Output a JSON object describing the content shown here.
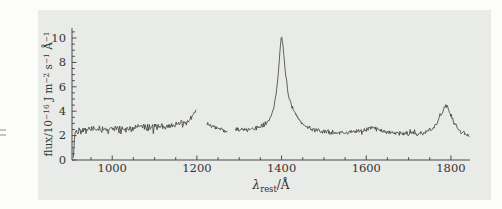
{
  "figure": {
    "page_bg": "#fcfcfb",
    "panel_bg": "#e9ebe8",
    "line_color": "#3c3c3c",
    "axis_color": "#4a4a4a",
    "text_color": "#333333"
  },
  "chart_data": {
    "type": "line",
    "title": "",
    "xlabel": "λ_rest/Å",
    "ylabel": "flux/10⁻¹⁶ J m⁻² s⁻¹ Å⁻¹",
    "xlabel_parts": [
      {
        "t": "λ",
        "style": "it"
      },
      {
        "t": "rest",
        "style": "sb"
      },
      {
        "t": "/Å",
        "style": ""
      }
    ],
    "ylabel_parts": [
      {
        "t": "flux/10",
        "style": ""
      },
      {
        "t": "−16",
        "style": "sp"
      },
      {
        "t": " J m",
        "style": ""
      },
      {
        "t": "−2",
        "style": "sp"
      },
      {
        "t": " s",
        "style": ""
      },
      {
        "t": "−1",
        "style": "sp"
      },
      {
        "t": " Å",
        "style": ""
      },
      {
        "t": "−1",
        "style": "sp"
      }
    ],
    "xlim": [
      905,
      1845
    ],
    "ylim": [
      0,
      10.8
    ],
    "x_major_ticks": [
      1000,
      1200,
      1400,
      1600,
      1800
    ],
    "x_minor_step": 50,
    "y_major_ticks": [
      0,
      2,
      4,
      6,
      8,
      10
    ],
    "y_minor_step": 0.5,
    "grid": false,
    "legend": "none",
    "noise_seed": 42,
    "segments": [
      {
        "noise": 0.26,
        "step": 1.5,
        "anchors": [
          [
            908,
            0.15
          ],
          [
            910,
            1.3
          ],
          [
            912,
            2.35
          ],
          [
            925,
            2.45
          ],
          [
            945,
            2.5
          ],
          [
            965,
            2.5
          ],
          [
            985,
            2.55
          ],
          [
            1005,
            2.5
          ],
          [
            1025,
            2.55
          ],
          [
            1045,
            2.6
          ],
          [
            1065,
            2.65
          ],
          [
            1085,
            2.7
          ],
          [
            1105,
            2.75
          ],
          [
            1125,
            2.8
          ],
          [
            1145,
            2.85
          ],
          [
            1162,
            2.9
          ],
          [
            1176,
            3.1
          ],
          [
            1187,
            3.45
          ],
          [
            1194,
            3.8
          ],
          [
            1198,
            4.15
          ]
        ]
      },
      {
        "noise": 0.15,
        "step": 1.5,
        "anchors": [
          [
            1224,
            2.95
          ],
          [
            1234,
            2.8
          ],
          [
            1244,
            2.65
          ],
          [
            1254,
            2.55
          ],
          [
            1264,
            2.45
          ],
          [
            1272,
            2.4
          ]
        ]
      },
      {
        "noise": 0.16,
        "step": 1.5,
        "anchors": [
          [
            1291,
            2.5
          ],
          [
            1305,
            2.45
          ],
          [
            1320,
            2.5
          ],
          [
            1335,
            2.55
          ],
          [
            1350,
            2.7
          ],
          [
            1362,
            2.95
          ],
          [
            1372,
            3.35
          ],
          [
            1380,
            4.0
          ],
          [
            1386,
            5.0
          ],
          [
            1391,
            6.6
          ],
          [
            1395,
            8.4
          ],
          [
            1398,
            9.9
          ],
          [
            1400,
            10.25
          ],
          [
            1402,
            9.7
          ],
          [
            1405,
            8.7
          ],
          [
            1409,
            7.2
          ],
          [
            1414,
            5.8
          ],
          [
            1421,
            4.7
          ],
          [
            1429,
            4.0
          ],
          [
            1437,
            3.5
          ],
          [
            1447,
            3.05
          ],
          [
            1458,
            2.75
          ],
          [
            1472,
            2.5
          ],
          [
            1490,
            2.35
          ],
          [
            1510,
            2.3
          ],
          [
            1530,
            2.25
          ],
          [
            1552,
            2.25
          ],
          [
            1572,
            2.3
          ],
          [
            1592,
            2.45
          ],
          [
            1606,
            2.6
          ],
          [
            1616,
            2.65
          ],
          [
            1626,
            2.5
          ],
          [
            1642,
            2.35
          ],
          [
            1660,
            2.25
          ],
          [
            1680,
            2.2
          ],
          [
            1700,
            2.15
          ],
          [
            1720,
            2.15
          ],
          [
            1740,
            2.25
          ],
          [
            1754,
            2.5
          ],
          [
            1766,
            2.95
          ],
          [
            1776,
            3.6
          ],
          [
            1783,
            4.2
          ],
          [
            1788,
            4.5
          ],
          [
            1792,
            4.35
          ],
          [
            1798,
            3.8
          ],
          [
            1805,
            3.2
          ],
          [
            1812,
            2.75
          ],
          [
            1820,
            2.4
          ],
          [
            1828,
            2.2
          ],
          [
            1836,
            2.1
          ],
          [
            1843,
            2.05
          ]
        ]
      }
    ]
  }
}
